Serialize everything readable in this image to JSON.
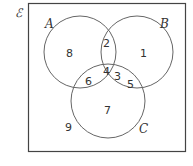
{
  "universal_set": {
    "symbol": "ℰ"
  },
  "sets": {
    "A": {
      "label": "A"
    },
    "B": {
      "label": "B"
    },
    "C": {
      "label": "C"
    }
  },
  "elements": {
    "A_only": "8",
    "B_only": "1",
    "A_and_B_only": "2",
    "A_and_B_and_C": "4",
    "A_and_C_only": "6",
    "B_and_C_only_1": "3",
    "B_and_C_only_2": "5",
    "C_only": "7",
    "outside": "9"
  }
}
